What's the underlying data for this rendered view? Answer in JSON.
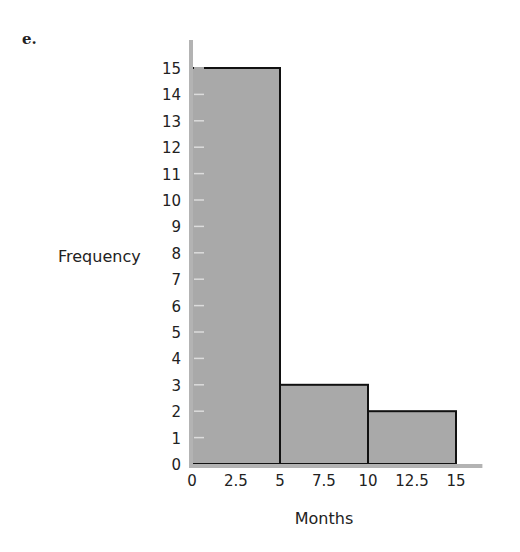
{
  "figure_label": "e.",
  "chart_data": {
    "type": "bar",
    "subtype": "histogram",
    "title": "",
    "xlabel": "Months",
    "ylabel": "Frequency",
    "bins": [
      {
        "start": 0,
        "end": 5,
        "value": 15
      },
      {
        "start": 5,
        "end": 10,
        "value": 3
      },
      {
        "start": 10,
        "end": 15,
        "value": 2
      }
    ],
    "categories": [
      "0-5",
      "5-10",
      "10-15"
    ],
    "values": [
      15,
      3,
      2
    ],
    "x_ticks": [
      "0",
      "2.5",
      "5",
      "7.5",
      "10",
      "12.5",
      "15"
    ],
    "y_ticks": [
      "0",
      "1",
      "2",
      "3",
      "4",
      "5",
      "6",
      "7",
      "8",
      "9",
      "10",
      "11",
      "12",
      "13",
      "14",
      "15"
    ],
    "xlim": [
      0,
      16.5
    ],
    "ylim": [
      0,
      16
    ],
    "grid": false,
    "legend": null,
    "colors": {
      "bar_fill": "#a9a9a9",
      "bar_edge": "#111111",
      "axis": "#b3b3b3",
      "tick_mark": "#dcdcdc"
    }
  }
}
